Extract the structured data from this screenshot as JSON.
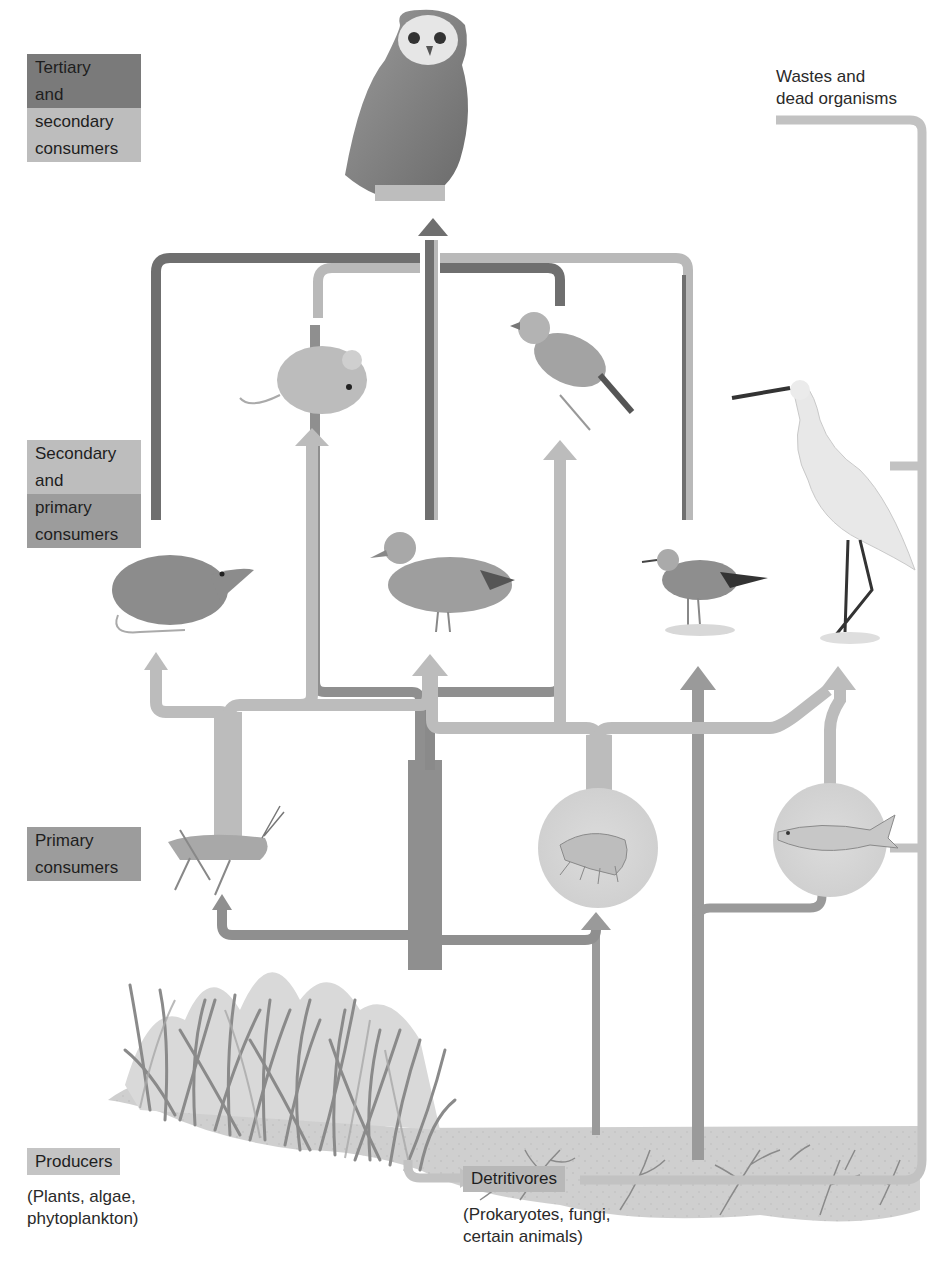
{
  "colors": {
    "dark_flow": "#6f6f6f",
    "light_flow": "#b9b9b9",
    "mid_flow": "#8f8f8f",
    "detritus_flow": "#c4c4c4",
    "circle_fill": "#d6d6d6",
    "ground_fill": "#cdcdcd",
    "label_dark": "#7a7a7a",
    "label_mid": "#9c9c9c",
    "label_light": "#bdbdbd"
  },
  "trophic_labels": {
    "tertiary": {
      "line1": "Tertiary",
      "line2": "and",
      "line3": "secondary",
      "line4": "consumers"
    },
    "secondary": {
      "line1": "Secondary",
      "line2": "and",
      "line3": "primary",
      "line4": "consumers"
    },
    "primary": {
      "line1": "Primary",
      "line2": "consumers"
    },
    "producers": {
      "title": "Producers",
      "desc_line1": "(Plants, algae,",
      "desc_line2": "phytoplankton)"
    },
    "detritivores": {
      "title": "Detritivores",
      "desc_line1": "(Prokaryotes, fungi,",
      "desc_line2": "certain animals)"
    },
    "wastes": {
      "line1": "Wastes and",
      "line2": "dead organisms"
    }
  },
  "organisms": [
    {
      "id": "owl",
      "level": "tertiary"
    },
    {
      "id": "mouse",
      "level": "secondary"
    },
    {
      "id": "sparrow",
      "level": "secondary"
    },
    {
      "id": "shrew",
      "level": "secondary"
    },
    {
      "id": "duck",
      "level": "secondary"
    },
    {
      "id": "sandpiper",
      "level": "secondary"
    },
    {
      "id": "egret",
      "level": "secondary"
    },
    {
      "id": "grasshopper",
      "level": "primary"
    },
    {
      "id": "amphipod",
      "level": "primary"
    },
    {
      "id": "fish",
      "level": "primary"
    },
    {
      "id": "grasses",
      "level": "producer"
    },
    {
      "id": "soil-detritus",
      "level": "detritivore"
    }
  ]
}
